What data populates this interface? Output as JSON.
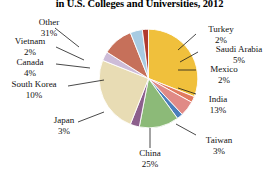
{
  "chart_data": {
    "type": "pie",
    "title": "in U.S. Colleges and Universities, 2012",
    "xlabel": "",
    "ylabel": "",
    "legend": "none",
    "grid": false,
    "categories": [
      "Other",
      "Turkey",
      "Saudi Arabia",
      "Mexico",
      "India",
      "Taiwan",
      "China",
      "Japan",
      "South Korea",
      "Canada",
      "Vietnam"
    ],
    "values": [
      31,
      2,
      5,
      2,
      13,
      3,
      25,
      3,
      10,
      4,
      2
    ],
    "unit": "%",
    "slices": [
      {
        "label": "Other",
        "pct_text": "31%",
        "value": 31,
        "color": "#f0c03c"
      },
      {
        "label": "Turkey",
        "pct_text": "2%",
        "value": 2,
        "color": "#e07a5f"
      },
      {
        "label": "Saudi Arabia",
        "pct_text": "5%",
        "value": 5,
        "color": "#e08a86"
      },
      {
        "label": "Mexico",
        "pct_text": "2%",
        "value": 2,
        "color": "#4a7ebb"
      },
      {
        "label": "India",
        "pct_text": "13%",
        "value": 13,
        "color": "#8cba78"
      },
      {
        "label": "Taiwan",
        "pct_text": "3%",
        "value": 3,
        "color": "#8c5f8c"
      },
      {
        "label": "China",
        "pct_text": "25%",
        "value": 25,
        "color": "#e8dcb4"
      },
      {
        "label": "Japan",
        "pct_text": "3%",
        "value": 3,
        "color": "#cdbcd8"
      },
      {
        "label": "South Korea",
        "pct_text": "10%",
        "value": 10,
        "color": "#c6705a"
      },
      {
        "label": "Canada",
        "pct_text": "4%",
        "value": 4,
        "color": "#a8cbe2"
      },
      {
        "label": "Vietnam",
        "pct_text": "2%",
        "value": 2,
        "color": "#b03a2e"
      }
    ]
  },
  "labels": {
    "other_name": "Other",
    "other_pct": "31%",
    "turkey_name": "Turkey",
    "turkey_pct": "2%",
    "saudi_name": "Saudi Arabia",
    "saudi_pct": "5%",
    "mexico_name": "Mexico",
    "mexico_pct": "2%",
    "india_name": "India",
    "india_pct": "13%",
    "taiwan_name": "Taiwan",
    "taiwan_pct": "3%",
    "china_name": "China",
    "china_pct": "25%",
    "japan_name": "Japan",
    "japan_pct": "3%",
    "korea_name": "South Korea",
    "korea_pct": "10%",
    "canada_name": "Canada",
    "canada_pct": "4%",
    "vietnam_name": "Vietnam",
    "vietnam_pct": "2%"
  }
}
